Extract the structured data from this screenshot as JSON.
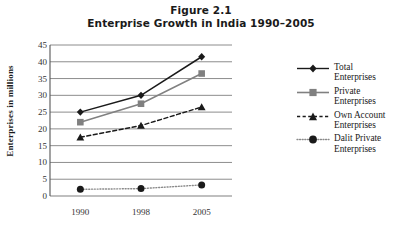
{
  "figure": {
    "label": "Figure 2.1",
    "title": "Enterprise Growth in India 1990–2005"
  },
  "chart_data": {
    "type": "line",
    "title": "Enterprise Growth in India 1990–2005",
    "subtitle": "Figure 2.1",
    "xlabel": "",
    "ylabel": "Enterprises in millions",
    "categories": [
      "1990",
      "1998",
      "2005"
    ],
    "x": [
      1990,
      1998,
      2005
    ],
    "ylim": [
      0,
      45
    ],
    "yticks": [
      0,
      5,
      10,
      15,
      20,
      25,
      30,
      35,
      40,
      45
    ],
    "grid": true,
    "legend_position": "right",
    "series": [
      {
        "name": "Total Enterprises",
        "values": [
          25,
          30,
          41.5
        ],
        "color": "#1a1a1a",
        "marker": "diamond",
        "linestyle": "solid"
      },
      {
        "name": "Private Enterprises",
        "values": [
          22,
          27.5,
          36.5
        ],
        "color": "#808080",
        "marker": "square",
        "linestyle": "solid"
      },
      {
        "name": "Own Account Enterprises",
        "values": [
          17.5,
          21,
          26.5
        ],
        "color": "#1a1a1a",
        "marker": "triangle",
        "linestyle": "dashed"
      },
      {
        "name": "Dalit Private Enterprises",
        "values": [
          2,
          2.2,
          3.3
        ],
        "color": "#808080",
        "marker": "circle",
        "linestyle": "dotted"
      }
    ]
  },
  "legend": {
    "items": [
      {
        "line1": "Total",
        "line2": "Enterprises"
      },
      {
        "line1": "Private",
        "line2": "Enterprises"
      },
      {
        "line1": "Own Account",
        "line2": "Enterprises"
      },
      {
        "line1": "Dalit Private",
        "line2": "Enterprises"
      }
    ]
  }
}
